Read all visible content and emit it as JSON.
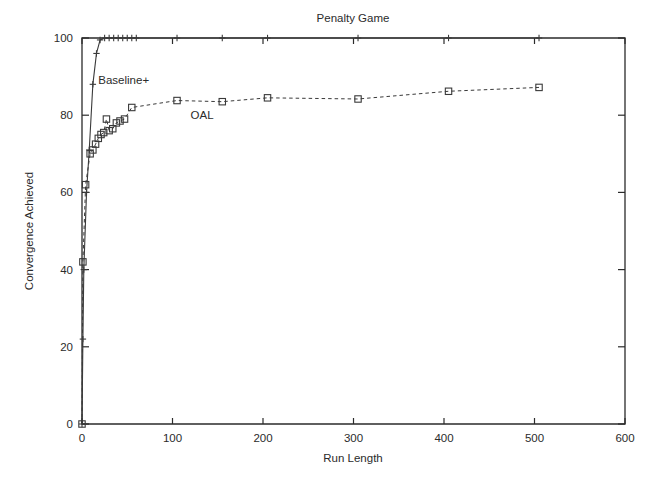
{
  "chart_data": {
    "type": "line",
    "title": "Penalty Game",
    "xlabel": "Run Length",
    "ylabel": "Convergence Achieved",
    "xlim": [
      0,
      600
    ],
    "ylim": [
      0,
      100
    ],
    "xticks": [
      0,
      100,
      200,
      300,
      400,
      500,
      600
    ],
    "yticks": [
      0,
      20,
      40,
      60,
      80,
      100
    ],
    "xtick_labels": [
      "0",
      "100",
      "200",
      "300",
      "400",
      "500",
      "600"
    ],
    "ytick_labels": [
      "0",
      "20",
      "40",
      "60",
      "80",
      "100"
    ],
    "grid": false,
    "legend": "inline-annotations",
    "annotations": [
      {
        "text": "Baseline+",
        "x": 18,
        "y": 88
      },
      {
        "text": "OAL",
        "x": 120,
        "y": 79
      }
    ],
    "series": [
      {
        "name": "Baseline+",
        "marker": "plus",
        "linestyle": "solid",
        "color": "#3a3a3a",
        "points": [
          {
            "x": 0,
            "y": 0
          },
          {
            "x": 1,
            "y": 22
          },
          {
            "x": 2,
            "y": 40
          },
          {
            "x": 5,
            "y": 60
          },
          {
            "x": 8,
            "y": 71
          },
          {
            "x": 12,
            "y": 88
          },
          {
            "x": 16,
            "y": 96
          },
          {
            "x": 20,
            "y": 99.5
          },
          {
            "x": 25,
            "y": 100
          },
          {
            "x": 30,
            "y": 100
          },
          {
            "x": 35,
            "y": 100
          },
          {
            "x": 40,
            "y": 100
          },
          {
            "x": 45,
            "y": 100
          },
          {
            "x": 50,
            "y": 100
          },
          {
            "x": 55,
            "y": 100
          },
          {
            "x": 60,
            "y": 100
          },
          {
            "x": 105,
            "y": 100
          },
          {
            "x": 155,
            "y": 100
          },
          {
            "x": 205,
            "y": 100
          },
          {
            "x": 305,
            "y": 100
          },
          {
            "x": 405,
            "y": 100
          },
          {
            "x": 505,
            "y": 100
          }
        ]
      },
      {
        "name": "OAL",
        "marker": "square",
        "linestyle": "dashed",
        "color": "#3a3a3a",
        "points": [
          {
            "x": 0,
            "y": 0
          },
          {
            "x": 1,
            "y": 42
          },
          {
            "x": 4,
            "y": 62
          },
          {
            "x": 9,
            "y": 70
          },
          {
            "x": 12,
            "y": 71
          },
          {
            "x": 15,
            "y": 72.5
          },
          {
            "x": 18,
            "y": 74
          },
          {
            "x": 21,
            "y": 75
          },
          {
            "x": 24,
            "y": 75.5
          },
          {
            "x": 27,
            "y": 79
          },
          {
            "x": 30,
            "y": 76
          },
          {
            "x": 34,
            "y": 76.5
          },
          {
            "x": 38,
            "y": 78
          },
          {
            "x": 42,
            "y": 78.5
          },
          {
            "x": 47,
            "y": 79
          },
          {
            "x": 55,
            "y": 82
          },
          {
            "x": 105,
            "y": 83.8
          },
          {
            "x": 155,
            "y": 83.5
          },
          {
            "x": 205,
            "y": 84.5
          },
          {
            "x": 305,
            "y": 84.2
          },
          {
            "x": 405,
            "y": 86.2
          },
          {
            "x": 505,
            "y": 87.2
          }
        ]
      }
    ]
  }
}
